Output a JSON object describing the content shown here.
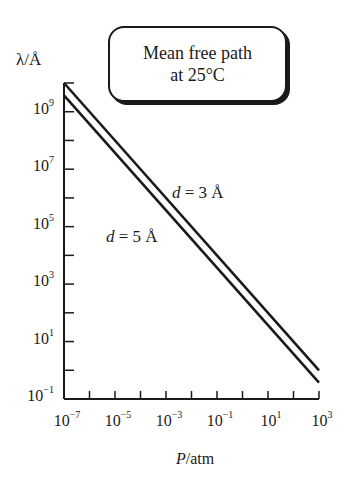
{
  "chart_data": {
    "type": "line",
    "title": "Mean free path at 25°C",
    "title_lines": [
      "Mean free path",
      "at 25°C"
    ],
    "xlabel": "P/atm",
    "ylabel": "λ/Å",
    "xscale": "log",
    "yscale": "log",
    "xlim": [
      1e-07,
      1000.0
    ],
    "ylim": [
      0.1,
      10000000000.0
    ],
    "x_ticks": [
      {
        "base": "10",
        "exp": "−7"
      },
      {
        "base": "10",
        "exp": "−5"
      },
      {
        "base": "10",
        "exp": "−3"
      },
      {
        "base": "10",
        "exp": "−1"
      },
      {
        "base": "10",
        "exp": "1"
      },
      {
        "base": "10",
        "exp": "3"
      }
    ],
    "y_ticks": [
      {
        "base": "10",
        "exp": "−1"
      },
      {
        "base": "10",
        "exp": "1"
      },
      {
        "base": "10",
        "exp": "3"
      },
      {
        "base": "10",
        "exp": "5"
      },
      {
        "base": "10",
        "exp": "7"
      },
      {
        "base": "10",
        "exp": "9"
      }
    ],
    "grid": false,
    "legend": "none (inline annotations)",
    "series": [
      {
        "name": "d = 3 Å",
        "x": [
          1e-07,
          1000.0
        ],
        "y": [
          10000000000.0,
          1.0
        ]
      },
      {
        "name": "d = 5 Å",
        "x": [
          1e-07,
          1000.0
        ],
        "y": [
          3700000000.0,
          0.37
        ]
      }
    ],
    "annotations": [
      {
        "text": "d = 3 Å",
        "italic_part": "d",
        "rest": " = 3 Å"
      },
      {
        "text": "d = 5 Å",
        "italic_part": "d",
        "rest": " = 5 Å"
      }
    ]
  }
}
